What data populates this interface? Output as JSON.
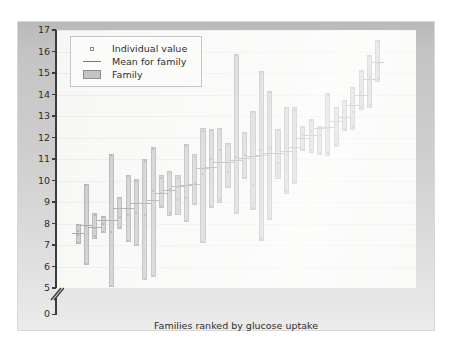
{
  "chart_data": {
    "type": "bar",
    "title": "",
    "xlabel": "Families ranked by glucose uptake",
    "ylabel": "Glucose uptake (mg/kg fat-free mass/min)",
    "ylim": [
      5,
      17
    ],
    "y_axis_break": true,
    "y_break_labels": [
      "0",
      "5"
    ],
    "yticks": [
      5,
      6,
      7,
      8,
      9,
      10,
      11,
      12,
      13,
      14,
      15,
      16,
      17
    ],
    "grid": true,
    "grid_axis": "y",
    "legend_position": "top-left",
    "legend": [
      {
        "key": "dot",
        "label": "Individual value"
      },
      {
        "key": "line",
        "label": "Mean for family"
      },
      {
        "key": "box",
        "label": "Family"
      }
    ],
    "series_name": "Family glucose uptake range",
    "x_description": "Families ranked by mean glucose uptake (ascending)",
    "families": [
      {
        "rank": 1,
        "min": 7.05,
        "max": 8.0,
        "mean": 7.55,
        "values": [
          7.1,
          7.45,
          7.65,
          7.95
        ]
      },
      {
        "rank": 2,
        "min": 6.05,
        "max": 9.85,
        "mean": 7.95,
        "values": [
          6.1,
          7.9,
          9.8
        ]
      },
      {
        "rank": 3,
        "min": 7.3,
        "max": 8.5,
        "mean": 7.85,
        "values": [
          7.4,
          7.8,
          8.4
        ]
      },
      {
        "rank": 4,
        "min": 7.55,
        "max": 8.35,
        "mean": 8.15,
        "values": [
          7.6,
          8.0,
          8.3
        ]
      },
      {
        "rank": 5,
        "min": 5.05,
        "max": 11.25,
        "mean": 8.15,
        "values": [
          5.1,
          7.6,
          11.2
        ]
      },
      {
        "rank": 6,
        "min": 7.75,
        "max": 9.25,
        "mean": 8.7,
        "values": [
          7.8,
          8.3,
          9.2
        ]
      },
      {
        "rank": 7,
        "min": 7.15,
        "max": 10.25,
        "mean": 8.7,
        "values": [
          7.2,
          8.4,
          10.2
        ]
      },
      {
        "rank": 8,
        "min": 6.95,
        "max": 10.05,
        "mean": 8.95,
        "values": [
          7.0,
          8.5,
          10.0
        ]
      },
      {
        "rank": 9,
        "min": 5.35,
        "max": 11.0,
        "mean": 8.95,
        "values": [
          5.4,
          8.4,
          10.9
        ]
      },
      {
        "rank": 10,
        "min": 5.5,
        "max": 11.55,
        "mean": 9.1,
        "values": [
          5.55,
          9.5,
          11.45
        ]
      },
      {
        "rank": 11,
        "min": 8.7,
        "max": 10.25,
        "mean": 9.4,
        "values": [
          8.8,
          9.4,
          10.1
        ]
      },
      {
        "rank": 12,
        "min": 8.35,
        "max": 10.45,
        "mean": 9.55,
        "values": [
          8.5,
          9.6,
          10.4
        ]
      },
      {
        "rank": 13,
        "min": 8.4,
        "max": 10.25,
        "mean": 9.75,
        "values": [
          9.1,
          9.7,
          10.1
        ]
      },
      {
        "rank": 14,
        "min": 8.05,
        "max": 11.7,
        "mean": 9.8,
        "values": [
          8.1,
          9.2,
          11.6
        ]
      },
      {
        "rank": 15,
        "min": 8.85,
        "max": 11.25,
        "mean": 9.85,
        "values": [
          8.9,
          9.9,
          11.1
        ]
      },
      {
        "rank": 16,
        "min": 7.1,
        "max": 12.45,
        "mean": 10.6,
        "values": [
          7.15,
          10.3,
          12.3
        ]
      },
      {
        "rank": 17,
        "min": 8.7,
        "max": 12.4,
        "mean": 10.65,
        "values": [
          8.8,
          11.0,
          12.35
        ]
      },
      {
        "rank": 18,
        "min": 8.95,
        "max": 12.45,
        "mean": 10.85,
        "values": [
          9.1,
          11.4,
          12.4
        ]
      },
      {
        "rank": 19,
        "min": 9.65,
        "max": 11.75,
        "mean": 10.85,
        "values": [
          9.7,
          10.4,
          11.7
        ]
      },
      {
        "rank": 20,
        "min": 8.45,
        "max": 15.9,
        "mean": 10.95,
        "values": [
          8.5,
          11.1,
          15.85
        ]
      },
      {
        "rank": 21,
        "min": 10.05,
        "max": 12.25,
        "mean": 11.05,
        "values": [
          10.1,
          11.2,
          12.2
        ]
      },
      {
        "rank": 22,
        "min": 8.65,
        "max": 13.25,
        "mean": 11.15,
        "values": [
          8.7,
          9.8,
          13.2
        ]
      },
      {
        "rank": 23,
        "min": 7.2,
        "max": 15.1,
        "mean": 11.2,
        "values": [
          7.3,
          11.4,
          15.05
        ]
      },
      {
        "rank": 24,
        "min": 8.15,
        "max": 14.15,
        "mean": 11.3,
        "values": [
          8.2,
          11.5,
          14.1
        ]
      },
      {
        "rank": 25,
        "min": 10.05,
        "max": 12.4,
        "mean": 11.3,
        "values": [
          10.2,
          10.8,
          12.35
        ]
      },
      {
        "rank": 26,
        "min": 9.35,
        "max": 13.4,
        "mean": 11.35,
        "values": [
          9.5,
          10.6,
          13.35
        ]
      },
      {
        "rank": 27,
        "min": 9.85,
        "max": 13.4,
        "mean": 11.55,
        "values": [
          10.0,
          11.5,
          13.3
        ]
      },
      {
        "rank": 28,
        "min": 11.35,
        "max": 12.55,
        "mean": 12.0,
        "values": [
          11.4,
          12.1,
          12.5
        ]
      },
      {
        "rank": 29,
        "min": 11.3,
        "max": 12.85,
        "mean": 12.1,
        "values": [
          11.4,
          12.3,
          12.8
        ]
      },
      {
        "rank": 30,
        "min": 11.2,
        "max": 12.55,
        "mean": 12.45,
        "values": [
          11.3,
          12.1,
          12.5
        ]
      },
      {
        "rank": 31,
        "min": 11.15,
        "max": 14.05,
        "mean": 12.5,
        "values": [
          11.3,
          12.4,
          14.0
        ]
      },
      {
        "rank": 32,
        "min": 11.55,
        "max": 13.4,
        "mean": 12.75,
        "values": [
          11.7,
          12.6,
          13.35
        ]
      },
      {
        "rank": 33,
        "min": 12.3,
        "max": 13.75,
        "mean": 12.95,
        "values": [
          12.4,
          12.9,
          13.7
        ]
      },
      {
        "rank": 34,
        "min": 12.35,
        "max": 14.35,
        "mean": 13.5,
        "values": [
          12.5,
          13.2,
          14.3
        ]
      },
      {
        "rank": 35,
        "min": 13.3,
        "max": 15.15,
        "mean": 14.0,
        "values": [
          13.4,
          14.1,
          15.1
        ]
      },
      {
        "rank": 36,
        "min": 13.35,
        "max": 15.85,
        "mean": 14.7,
        "values": [
          13.5,
          14.8,
          15.8
        ]
      },
      {
        "rank": 37,
        "min": 14.6,
        "max": 16.55,
        "mean": 15.5,
        "values": [
          14.7,
          15.4,
          16.5
        ]
      }
    ]
  },
  "colors": {
    "bar_fill": "#b6b6b6",
    "bar_edge": "#8e8e8e",
    "mean_line": "#7a7a7a",
    "plot_bg": "#f4f4f2",
    "grid": "#e3e3e0",
    "axis": "#3b3b3b",
    "page_frame": "#cfcfcf",
    "text": "#2e2e2e"
  }
}
